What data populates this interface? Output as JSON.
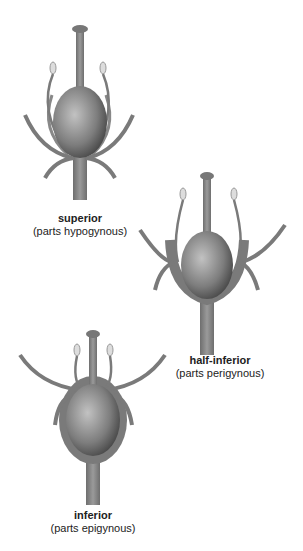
{
  "diagrams": [
    {
      "id": "superior",
      "title": "superior",
      "subtitle": "(parts hypogynous)"
    },
    {
      "id": "half-inferior",
      "title": "half-inferior",
      "subtitle": "(parts perigynous)"
    },
    {
      "id": "inferior",
      "title": "inferior",
      "subtitle": "(parts epigynous)"
    }
  ],
  "colors": {
    "stem": "#7a7a7a",
    "ovary_light": "#b8b8b8",
    "ovary_dark": "#3a3a3a",
    "anther": "#d8d8d8",
    "text": "#222222"
  }
}
